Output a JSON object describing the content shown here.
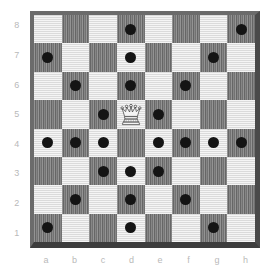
{
  "diagram": {
    "piece": {
      "name": "white-queen",
      "glyph": "♕",
      "square": "d4",
      "file_index": 3,
      "rank_index": 3
    }
  },
  "board": {
    "files": [
      "a",
      "b",
      "c",
      "d",
      "e",
      "f",
      "g",
      "h"
    ],
    "ranks": [
      "8",
      "7",
      "6",
      "5",
      "4",
      "3",
      "2",
      "1"
    ],
    "colors": {
      "light_square": "#e9e9e9",
      "dark_square": "#7f7f7f",
      "frame": "#6b6b6b",
      "frame_shadow": "#3d3d3d",
      "marker": "#141414",
      "label": "#b9b9b9",
      "background": "#ffffff"
    },
    "marked_squares": [
      "d8",
      "h8",
      "a7",
      "d7",
      "g7",
      "b6",
      "d6",
      "f6",
      "c5",
      "d5",
      "e5",
      "a4",
      "b4",
      "c4",
      "e4",
      "f4",
      "g4",
      "h4",
      "c3",
      "d3",
      "e3",
      "b2",
      "d2",
      "f2",
      "a1",
      "d1",
      "g1"
    ],
    "rows": [
      {
        "rank": "8",
        "marks": [
          false,
          false,
          false,
          true,
          false,
          false,
          false,
          true
        ]
      },
      {
        "rank": "7",
        "marks": [
          true,
          false,
          false,
          true,
          false,
          false,
          true,
          false
        ]
      },
      {
        "rank": "6",
        "marks": [
          false,
          true,
          false,
          true,
          false,
          true,
          false,
          false
        ]
      },
      {
        "rank": "5",
        "marks": [
          false,
          false,
          true,
          true,
          true,
          false,
          false,
          false
        ]
      },
      {
        "rank": "4",
        "marks": [
          true,
          true,
          true,
          false,
          true,
          true,
          true,
          true
        ]
      },
      {
        "rank": "3",
        "marks": [
          false,
          false,
          true,
          true,
          true,
          false,
          false,
          false
        ]
      },
      {
        "rank": "2",
        "marks": [
          false,
          true,
          false,
          true,
          false,
          true,
          false,
          false
        ]
      },
      {
        "rank": "1",
        "marks": [
          true,
          false,
          false,
          true,
          false,
          false,
          true,
          false
        ]
      }
    ]
  },
  "chart_data": {
    "type": "heatmap",
    "xlabel": "",
    "ylabel": "",
    "x": [
      "a",
      "b",
      "c",
      "d",
      "e",
      "f",
      "g",
      "h"
    ],
    "y": [
      "8",
      "7",
      "6",
      "5",
      "4",
      "3",
      "2",
      "1"
    ],
    "legend": [],
    "grid": true,
    "values": [
      [
        0,
        0,
        0,
        1,
        0,
        0,
        0,
        1
      ],
      [
        1,
        0,
        0,
        1,
        0,
        0,
        1,
        0
      ],
      [
        0,
        1,
        0,
        1,
        0,
        1,
        0,
        0
      ],
      [
        0,
        0,
        1,
        1,
        1,
        0,
        0,
        0
      ],
      [
        1,
        1,
        1,
        2,
        1,
        1,
        1,
        1
      ],
      [
        0,
        0,
        1,
        1,
        1,
        0,
        0,
        0
      ],
      [
        0,
        1,
        0,
        1,
        0,
        1,
        0,
        0
      ],
      [
        1,
        0,
        0,
        1,
        0,
        0,
        1,
        0
      ]
    ],
    "series": [
      {
        "name": "attacked-squares",
        "values": 27
      },
      {
        "name": "queen-position",
        "values": 1
      }
    ]
  }
}
